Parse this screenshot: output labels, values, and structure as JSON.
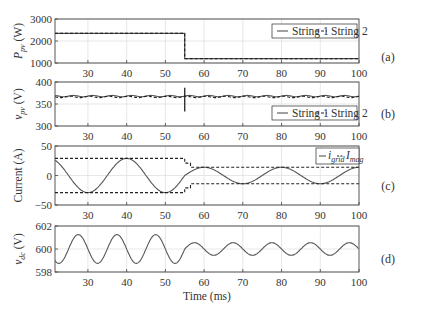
{
  "chart_data": [
    {
      "panel": "(a)",
      "type": "line",
      "ylabel": "P_pv (W)",
      "ylabel_main": "P",
      "ylabel_sub": "pv",
      "ylabel_unit": " (W)",
      "xlim": [
        21.5,
        100
      ],
      "ylim": [
        1000,
        3000
      ],
      "yticks": [
        1000,
        2000,
        3000
      ],
      "xticks": [
        30,
        40,
        50,
        60,
        70,
        80,
        90,
        100
      ],
      "grid": true,
      "legend": {
        "position": "upper right",
        "entries": [
          "String 1",
          "String 2"
        ]
      },
      "series": [
        {
          "name": "String 1",
          "style": "solid",
          "x": [
            21.5,
            55,
            55,
            100
          ],
          "y": [
            2350,
            2350,
            1200,
            1200
          ]
        },
        {
          "name": "String 2",
          "style": "dashed",
          "x": [
            21.5,
            55,
            55,
            100
          ],
          "y": [
            2350,
            2350,
            1200,
            1200
          ]
        }
      ]
    },
    {
      "panel": "(b)",
      "type": "line",
      "ylabel": "v_pv (V)",
      "ylabel_main": "v",
      "ylabel_sub": "pv",
      "ylabel_unit": " (V)",
      "xlim": [
        21.5,
        100
      ],
      "ylim": [
        300,
        400
      ],
      "yticks": [
        300,
        350,
        400
      ],
      "xticks": [
        30,
        40,
        50,
        60,
        70,
        80,
        90,
        100
      ],
      "grid": true,
      "legend": {
        "position": "lower right",
        "entries": [
          "String 1",
          "String 2"
        ]
      },
      "series": [
        {
          "name": "String 1",
          "style": "solid",
          "mean": 368,
          "ripple_amp": 1.5,
          "ripple_period_ms": 5,
          "transient": {
            "x": 55,
            "ymin": 333,
            "ymax": 387
          }
        },
        {
          "name": "String 2",
          "style": "dashed",
          "mean": 366,
          "ripple_amp": 1.5,
          "ripple_period_ms": 5
        }
      ]
    },
    {
      "panel": "(c)",
      "type": "line",
      "ylabel": "Current (A)",
      "xlim": [
        21.5,
        100
      ],
      "ylim": [
        -50,
        50
      ],
      "yticks": [
        -50,
        0,
        50
      ],
      "xticks": [
        30,
        40,
        50,
        60,
        70,
        80,
        90,
        100
      ],
      "grid": true,
      "legend": {
        "position": "upper right",
        "entries": [
          "i_grid",
          "I_mag"
        ]
      },
      "series": [
        {
          "name": "i_grid",
          "style": "solid",
          "waveform": "cosine",
          "period_ms": 20,
          "peak_time_ms": 40,
          "amplitude_before": 29,
          "amplitude_after": 14,
          "step_time_ms": 55
        },
        {
          "name": "I_mag",
          "style": "dashed",
          "x": [
            21.5,
            55,
            55,
            56.5,
            56.5,
            100
          ],
          "y_upper": [
            29,
            29,
            21,
            21,
            14,
            14
          ],
          "y_lower": [
            -29,
            -29,
            -21,
            -21,
            -14,
            -14
          ]
        }
      ]
    },
    {
      "panel": "(d)",
      "type": "line",
      "ylabel": "v_dc (V)",
      "ylabel_main": "v",
      "ylabel_sub": "dc",
      "ylabel_unit": " (V)",
      "xlabel": "Time (ms)",
      "xlim": [
        21.5,
        100
      ],
      "ylim": [
        598,
        602
      ],
      "yticks": [
        598,
        600,
        602
      ],
      "xticks": [
        30,
        40,
        50,
        60,
        70,
        80,
        90,
        100
      ],
      "grid": true,
      "series": [
        {
          "name": "v_dc",
          "style": "solid",
          "waveform": "sine",
          "mean": 600,
          "period_ms": 10,
          "peak_time_ms": 27.5,
          "amplitude_before": 1.25,
          "amplitude_after": 0.55,
          "step_time_ms": 55
        }
      ]
    }
  ],
  "labels": {
    "panel_a": "(a)",
    "panel_b": "(b)",
    "panel_c": "(c)",
    "panel_d": "(d)",
    "xlabel": "Time (ms)",
    "legend_string1": "String 1",
    "legend_string2": "String 2",
    "legend_igrid_main": "i",
    "legend_igrid_sub": "grid",
    "legend_imag_main": "I",
    "legend_imag_sub": "mag",
    "current_ylabel": "Current (A)"
  },
  "colors": {
    "line": "#555555",
    "dashed": "#222222",
    "axis": "#444444",
    "grid": "#dddddd",
    "text": "#333333"
  }
}
